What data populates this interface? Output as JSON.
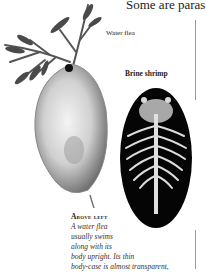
{
  "page": {
    "headline": "Some are paras",
    "labels": {
      "water_flea": "Water flea",
      "brine_shrimp": "Brine shrimp"
    },
    "caption": {
      "heading": "Above left",
      "lines": [
        "A water flea",
        "usually swims",
        "along with its",
        "body upright. Its thin",
        "body-case is almost transparent,"
      ]
    },
    "colors": {
      "background": "#ffffff",
      "text": "#1a1a1a",
      "shrimp_background": "#000000"
    }
  }
}
